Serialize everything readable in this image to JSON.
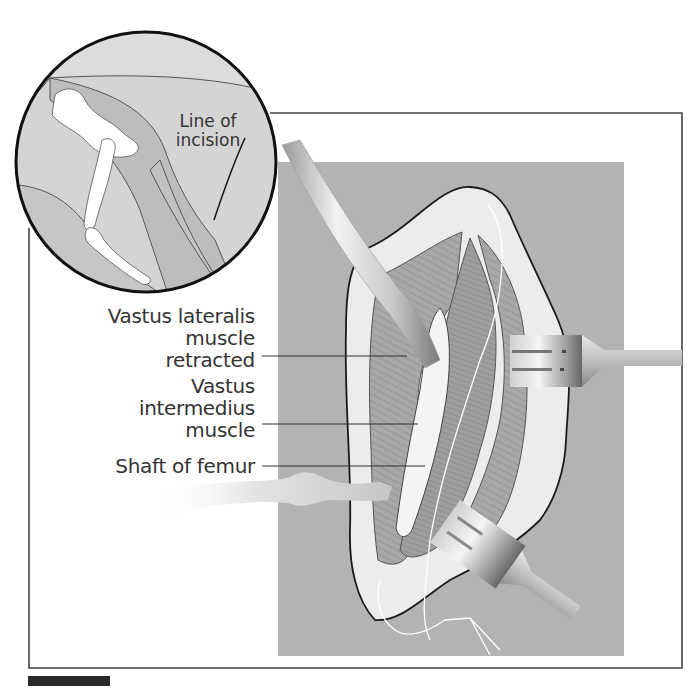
{
  "figure": {
    "inset": {
      "label_line1": "Line of",
      "label_line2": "incision"
    },
    "labels": [
      {
        "id": "vastus-lateralis",
        "lines": [
          "Vastus lateralis",
          "muscle",
          "retracted"
        ]
      },
      {
        "id": "vastus-intermedius",
        "lines": [
          "Vastus",
          "intermedius",
          "muscle"
        ]
      },
      {
        "id": "shaft-of-femur",
        "lines": [
          "Shaft of femur"
        ]
      }
    ],
    "colors": {
      "panel_gray": "#b3b3b3",
      "skin_light": "#ececec",
      "muscle": "#9c9c9c",
      "inset_bg": "#d8d8d8",
      "inset_dark": "#b8b8b8",
      "bone": "#ffffff",
      "frame": "#444444",
      "text": "#333333"
    }
  }
}
